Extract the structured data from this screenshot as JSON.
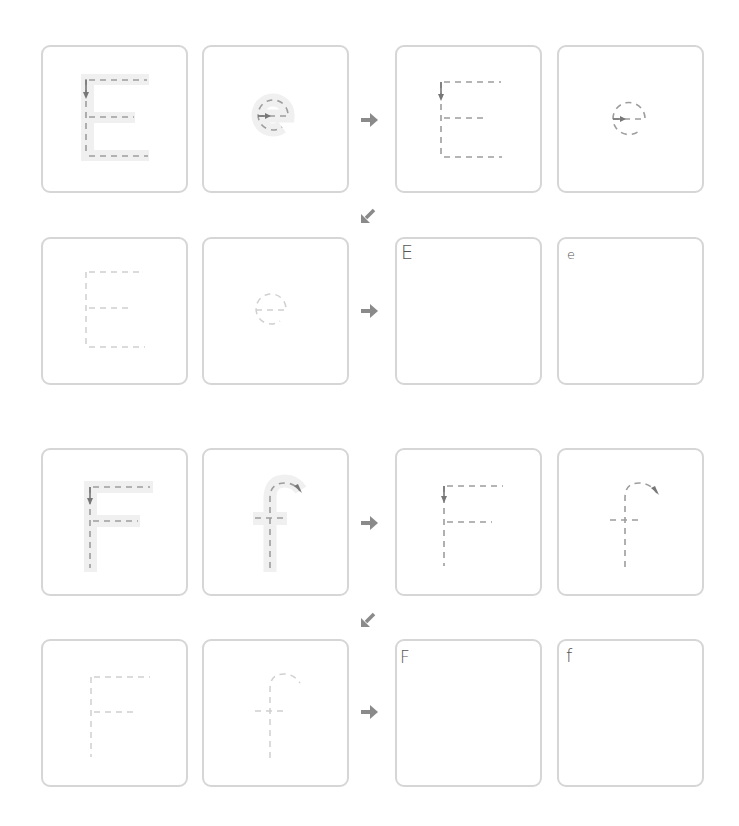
{
  "worksheet": {
    "colors": {
      "card_border": "#d6d6d6",
      "guide_band": "#f0f0f0",
      "dash_stroke": "#9d9d9d",
      "faded_stroke": "#d0d0d0",
      "arrow": "#888888",
      "label_text": "#555555"
    },
    "sections": [
      {
        "letter_upper": "E",
        "letter_lower": "e",
        "rows": [
          {
            "cards": [
              {
                "type": "guided-trace",
                "glyph": "E"
              },
              {
                "type": "guided-trace",
                "glyph": "e"
              },
              {
                "type": "dashed-trace",
                "glyph": "E"
              },
              {
                "type": "dashed-trace",
                "glyph": "e"
              }
            ],
            "connector_icon": "arrow-right-icon"
          },
          {
            "cards": [
              {
                "type": "faded-trace",
                "glyph": "E"
              },
              {
                "type": "faded-trace",
                "glyph": "e"
              },
              {
                "type": "blank-write",
                "label": "E"
              },
              {
                "type": "blank-write",
                "label": "e"
              }
            ],
            "connector_icon": "arrow-right-icon"
          }
        ],
        "row_link_icon": "arrow-down-left-icon"
      },
      {
        "letter_upper": "F",
        "letter_lower": "f",
        "rows": [
          {
            "cards": [
              {
                "type": "guided-trace",
                "glyph": "F"
              },
              {
                "type": "guided-trace",
                "glyph": "f"
              },
              {
                "type": "dashed-trace",
                "glyph": "F"
              },
              {
                "type": "dashed-trace",
                "glyph": "f"
              }
            ],
            "connector_icon": "arrow-right-icon"
          },
          {
            "cards": [
              {
                "type": "faded-trace",
                "glyph": "F"
              },
              {
                "type": "faded-trace",
                "glyph": "f"
              },
              {
                "type": "blank-write",
                "label": "F"
              },
              {
                "type": "blank-write",
                "label": "f"
              }
            ],
            "connector_icon": "arrow-right-icon"
          }
        ],
        "row_link_icon": "arrow-down-left-icon"
      }
    ]
  }
}
